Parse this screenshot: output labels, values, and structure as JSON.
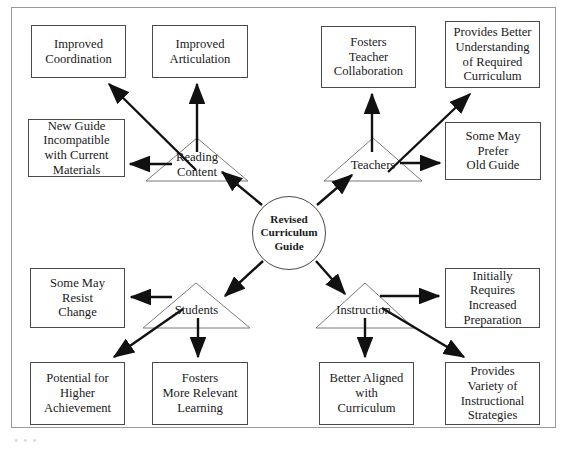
{
  "figure": {
    "type": "fishbone-style radial consequence diagram",
    "background_color": "#ffffff",
    "frame_color": "#9a9a9a",
    "shape_stroke_color": "#4a4a4a",
    "arrow_color": "#111111",
    "text_color": "#1a1a1a",
    "bottom_artifact": "• • •"
  },
  "center": {
    "label": "Revised\nCurriculum\nGuide",
    "line1": "Revised",
    "line2": "Curriculum",
    "line3": "Guide"
  },
  "branches": [
    {
      "id": "reading-content",
      "label": "Reading\nContent",
      "label_line1": "Reading",
      "label_line2": "Content",
      "quadrant": "top-left",
      "outcomes": [
        {
          "id": "improved-coordination",
          "label": "Improved\nCoordination",
          "valence": "positive"
        },
        {
          "id": "improved-articulation",
          "label": "Improved\nArticulation",
          "valence": "positive"
        },
        {
          "id": "new-guide-incompatible",
          "label": "New Guide\nIncompatible\nwith Current\nMaterials",
          "valence": "negative"
        }
      ]
    },
    {
      "id": "teachers",
      "label": "Teachers",
      "quadrant": "top-right",
      "outcomes": [
        {
          "id": "fosters-teacher-collaboration",
          "label": "Fosters\nTeacher\nCollaboration",
          "valence": "positive"
        },
        {
          "id": "provides-better-understanding",
          "label": "Provides Better\nUnderstanding\nof Required\nCurriculum",
          "valence": "positive"
        },
        {
          "id": "some-may-prefer-old-guide",
          "label": "Some May\nPrefer\nOld Guide",
          "valence": "negative"
        }
      ]
    },
    {
      "id": "students",
      "label": "Students",
      "quadrant": "bottom-left",
      "outcomes": [
        {
          "id": "some-may-resist-change",
          "label": "Some May\nResist\nChange",
          "valence": "negative"
        },
        {
          "id": "potential-for-higher-achievement",
          "label": "Potential for\nHigher\nAchievement",
          "valence": "positive"
        },
        {
          "id": "fosters-more-relevant-learning",
          "label": "Fosters\nMore Relevant\nLearning",
          "valence": "positive"
        }
      ]
    },
    {
      "id": "instruction",
      "label": "Instruction",
      "quadrant": "bottom-right",
      "outcomes": [
        {
          "id": "initially-requires-increased-preparation",
          "label": "Initially\nRequires\nIncreased\nPreparation",
          "valence": "negative"
        },
        {
          "id": "better-aligned-with-curriculum",
          "label": "Better Aligned\nwith\nCurriculum",
          "valence": "positive"
        },
        {
          "id": "provides-variety-of-instructional-strategies",
          "label": "Provides\nVariety of\nInstructional\nStrategies",
          "valence": "positive"
        }
      ]
    }
  ],
  "boxes": {
    "improved_coordination": "Improved\nCoordination",
    "improved_articulation": "Improved\nArticulation",
    "new_guide_incompatible": "New Guide\nIncompatible\nwith Current\nMaterials",
    "fosters_teacher_collaboration": "Fosters\nTeacher\nCollaboration",
    "provides_better_understanding": "Provides Better\nUnderstanding\nof Required\nCurriculum",
    "some_may_prefer_old_guide": "Some May\nPrefer\nOld Guide",
    "some_may_resist_change": "Some May\nResist\nChange",
    "potential_for_higher_achievement": "Potential for\nHigher\nAchievement",
    "fosters_more_relevant_learning": "Fosters\nMore Relevant\nLearning",
    "initially_requires_increased_preparation": "Initially\nRequires\nIncreased\nPreparation",
    "better_aligned_with_curriculum": "Better Aligned\nwith\nCurriculum",
    "provides_variety_of_instructional_strategies": "Provides\nVariety of\nInstructional\nStrategies"
  },
  "triangles": {
    "reading_content": "Reading\nContent",
    "teachers": "Teachers",
    "students": "Students",
    "instruction": "Instruction"
  }
}
